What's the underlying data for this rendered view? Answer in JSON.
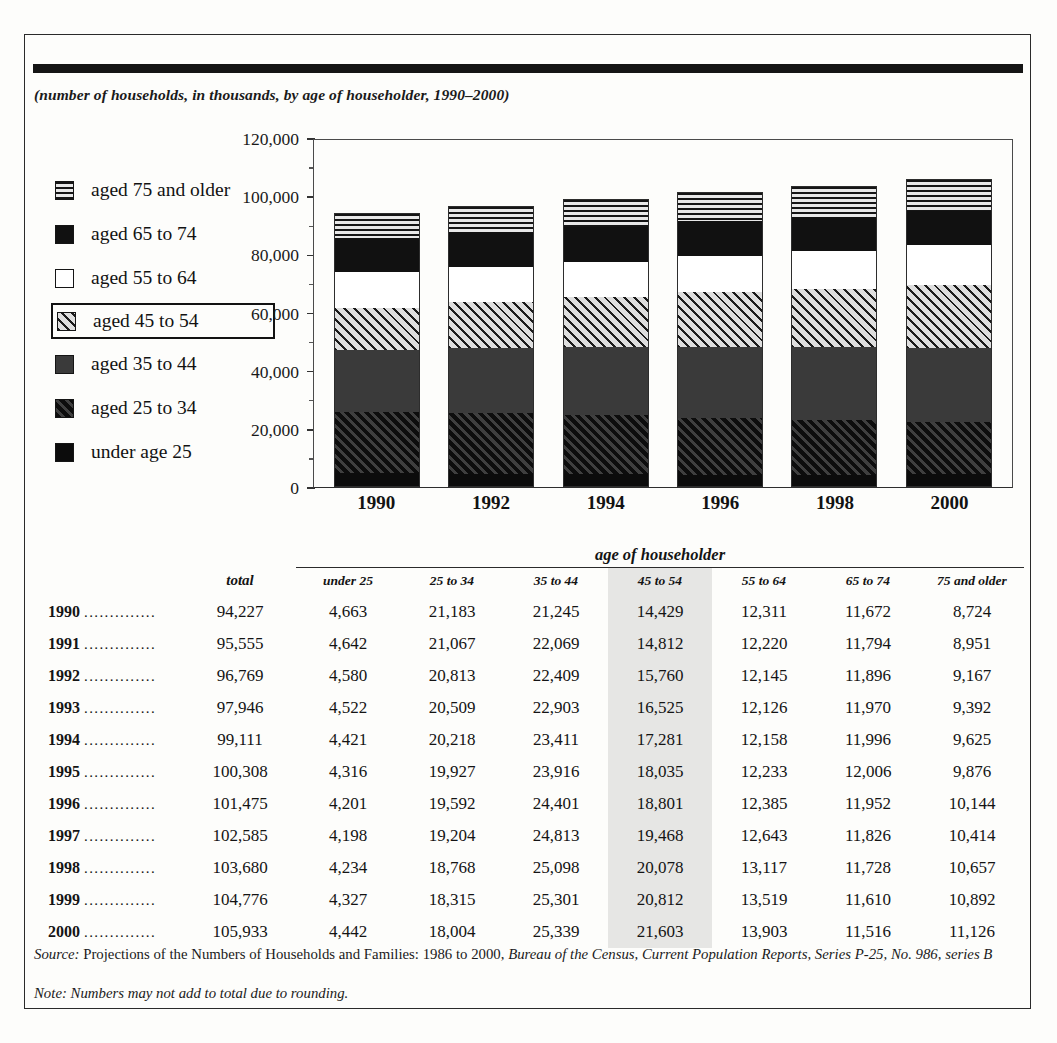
{
  "subtitle": "(number of households, in thousands, by age of householder, 1990–2000)",
  "legend": {
    "items": [
      {
        "label": "aged 75 and older",
        "pattern": "p-hstripe",
        "highlighted": false
      },
      {
        "label": "aged 65 to 74",
        "pattern": "p-solid",
        "highlighted": false
      },
      {
        "label": "aged 55 to 64",
        "pattern": "p-white",
        "highlighted": false
      },
      {
        "label": "aged 45 to 54",
        "pattern": "p-lhatch",
        "highlighted": true
      },
      {
        "label": "aged 35 to 44",
        "pattern": "p-dgray",
        "highlighted": false
      },
      {
        "label": "aged 25 to 34",
        "pattern": "p-dhatch",
        "highlighted": false
      },
      {
        "label": "under age 25",
        "pattern": "p-black",
        "highlighted": false
      }
    ]
  },
  "chart_data": {
    "type": "bar",
    "stacked": true,
    "title": "",
    "subtitle": "(number of households, in thousands, by age of householder, 1990–2000)",
    "xlabel": "",
    "ylabel": "",
    "ylim": [
      0,
      120000
    ],
    "ytick_labels": [
      "120,000",
      "100,000",
      "80,000",
      "60,000",
      "40,000",
      "20,000",
      "0"
    ],
    "ytick_values": [
      120000,
      100000,
      80000,
      60000,
      40000,
      20000,
      0
    ],
    "minor_tick_interval": 10000,
    "grid": false,
    "legend_position": "left",
    "categories": [
      "1990",
      "1992",
      "1994",
      "1996",
      "1998",
      "2000"
    ],
    "series": [
      {
        "name": "under age 25",
        "pattern": "p-black",
        "values": [
          4663,
          4580,
          4421,
          4201,
          4234,
          4442
        ]
      },
      {
        "name": "aged 25 to 34",
        "pattern": "p-dhatch",
        "values": [
          21183,
          20813,
          20218,
          19592,
          18768,
          18004
        ]
      },
      {
        "name": "aged 35 to 44",
        "pattern": "p-dgray",
        "values": [
          21245,
          22409,
          23411,
          24401,
          25098,
          25339
        ]
      },
      {
        "name": "aged 45 to 54",
        "pattern": "p-lhatch",
        "values": [
          14429,
          15760,
          17281,
          18801,
          20078,
          21603
        ]
      },
      {
        "name": "aged 55 to 64",
        "pattern": "p-white",
        "values": [
          12311,
          12145,
          12158,
          12385,
          13117,
          13903
        ]
      },
      {
        "name": "aged 65 to 74",
        "pattern": "p-solid",
        "values": [
          11672,
          11896,
          11996,
          11952,
          11728,
          11516
        ]
      },
      {
        "name": "aged 75 and older",
        "pattern": "p-hstripe",
        "values": [
          8724,
          9167,
          9625,
          10144,
          10657,
          11126
        ]
      }
    ],
    "totals": [
      94227,
      96769,
      99111,
      101475,
      103680,
      105933
    ]
  },
  "table": {
    "group_header": "age of householder",
    "total_header": "total",
    "age_headers": [
      "under 25",
      "25 to 34",
      "35 to 44",
      "45 to 54",
      "55 to 64",
      "65 to 74",
      "75 and older"
    ],
    "highlight_column": "45 to 54",
    "leader": "..............",
    "rows": [
      {
        "year": "1990",
        "total": "94,227",
        "cells": [
          "4,663",
          "21,183",
          "21,245",
          "14,429",
          "12,311",
          "11,672",
          "8,724"
        ]
      },
      {
        "year": "1991",
        "total": "95,555",
        "cells": [
          "4,642",
          "21,067",
          "22,069",
          "14,812",
          "12,220",
          "11,794",
          "8,951"
        ]
      },
      {
        "year": "1992",
        "total": "96,769",
        "cells": [
          "4,580",
          "20,813",
          "22,409",
          "15,760",
          "12,145",
          "11,896",
          "9,167"
        ]
      },
      {
        "year": "1993",
        "total": "97,946",
        "cells": [
          "4,522",
          "20,509",
          "22,903",
          "16,525",
          "12,126",
          "11,970",
          "9,392"
        ]
      },
      {
        "year": "1994",
        "total": "99,111",
        "cells": [
          "4,421",
          "20,218",
          "23,411",
          "17,281",
          "12,158",
          "11,996",
          "9,625"
        ]
      },
      {
        "year": "1995",
        "total": "100,308",
        "cells": [
          "4,316",
          "19,927",
          "23,916",
          "18,035",
          "12,233",
          "12,006",
          "9,876"
        ]
      },
      {
        "year": "1996",
        "total": "101,475",
        "cells": [
          "4,201",
          "19,592",
          "24,401",
          "18,801",
          "12,385",
          "11,952",
          "10,144"
        ]
      },
      {
        "year": "1997",
        "total": "102,585",
        "cells": [
          "4,198",
          "19,204",
          "24,813",
          "19,468",
          "12,643",
          "11,826",
          "10,414"
        ]
      },
      {
        "year": "1998",
        "total": "103,680",
        "cells": [
          "4,234",
          "18,768",
          "25,098",
          "20,078",
          "13,117",
          "11,728",
          "10,657"
        ]
      },
      {
        "year": "1999",
        "total": "104,776",
        "cells": [
          "4,327",
          "18,315",
          "25,301",
          "20,812",
          "13,519",
          "11,610",
          "10,892"
        ]
      },
      {
        "year": "2000",
        "total": "105,933",
        "cells": [
          "4,442",
          "18,004",
          "25,339",
          "21,603",
          "13,903",
          "11,516",
          "11,126"
        ]
      }
    ]
  },
  "footer": {
    "source_label": "Source:",
    "source_text": " Projections of the Numbers of Households and Families: 1986 to 2000, ",
    "source_italic": "Bureau of the Census, Current Population Reports, Series P-25, No. 986, series B",
    "note_label": "Note:",
    "note_text": " Numbers may not add to total due to rounding."
  }
}
